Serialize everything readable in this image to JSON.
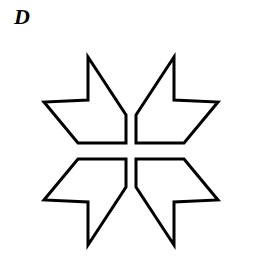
{
  "figure": {
    "label": "D",
    "label_name": "panel-label-d",
    "background_color": "#ffffff",
    "stroke_color": "#000000",
    "fill_color": "#ffffff",
    "stroke_width": 3,
    "center": {
      "x": 131,
      "y": 151
    },
    "symmetry": "mirror symmetry about vertical and horizontal axes through center",
    "quadrants": [
      {
        "name": "top-left-arrow",
        "points": "88,57 88,100 44,102 78,143 126,143 126,115"
      },
      {
        "name": "top-right-arrow",
        "points": "174,57 174,100 218,102 184,143 136,143 136,115"
      },
      {
        "name": "bottom-left-arrow",
        "points": "88,245 88,202 44,200 78,159 126,159 126,187"
      },
      {
        "name": "bottom-right-arrow",
        "points": "174,245 174,202 218,200 184,159 136,159 136,187"
      }
    ]
  },
  "chart_data": {
    "type": "diagram",
    "title": "D",
    "shape": "pinwheel star outline composed of four arrow polygons",
    "element_count": 4,
    "colors": {
      "stroke": "#000000",
      "fill": "#ffffff",
      "background": "#ffffff"
    }
  }
}
